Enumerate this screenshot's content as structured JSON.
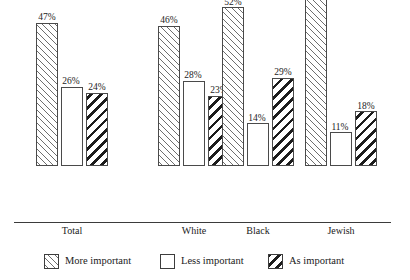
{
  "caption_remnant": "ypg pp",
  "chart_data": {
    "type": "bar",
    "title": "",
    "xlabel": "",
    "ylabel": "",
    "ylim": [
      0,
      70
    ],
    "grid": false,
    "legend_position": "bottom",
    "value_suffix": "%",
    "categories": [
      "Total",
      "White",
      "Black",
      "Jewish"
    ],
    "series": [
      {
        "name": "More important",
        "pattern": "diagonal-forward-hatch",
        "values": [
          47,
          46,
          52,
          64
        ],
        "labels": [
          "47%",
          "46%",
          "52%",
          "64%"
        ]
      },
      {
        "name": "Less important",
        "pattern": "empty-white",
        "values": [
          26,
          28,
          14,
          11
        ],
        "labels": [
          "26%",
          "28%",
          "14%",
          "11%"
        ]
      },
      {
        "name": "As important",
        "pattern": "diagonal-back-hatch-bold",
        "values": [
          24,
          23,
          29,
          18
        ],
        "labels": [
          "24%",
          "23%",
          "29%",
          "18%"
        ]
      }
    ]
  },
  "legend": {
    "items": [
      {
        "label": "More important",
        "pattern": "more"
      },
      {
        "label": "Less important",
        "pattern": "less"
      },
      {
        "label": "As important",
        "pattern": "as"
      }
    ]
  },
  "colors": {
    "axis": "#3b3b3b",
    "bar_outline": "#4a4a4a",
    "hatch_light": "#6e6e6e",
    "hatch_bold": "#1c1c1c",
    "background": "#ffffff",
    "text": "#1a1a1a"
  }
}
